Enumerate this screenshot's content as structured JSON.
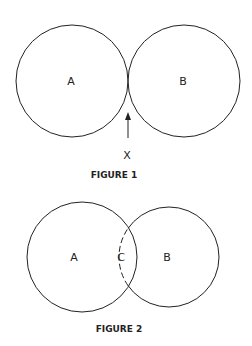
{
  "figure1": {
    "caption": "FIGURE 1",
    "circle_a_label": "A",
    "circle_b_label": "B",
    "arrow_label": "X"
  },
  "figure2": {
    "caption": "FIGURE 2",
    "circle_a_label": "A",
    "overlap_label": "C",
    "circle_b_label": "B"
  },
  "colors": {
    "stroke": "#222222",
    "background": "#ffffff"
  }
}
